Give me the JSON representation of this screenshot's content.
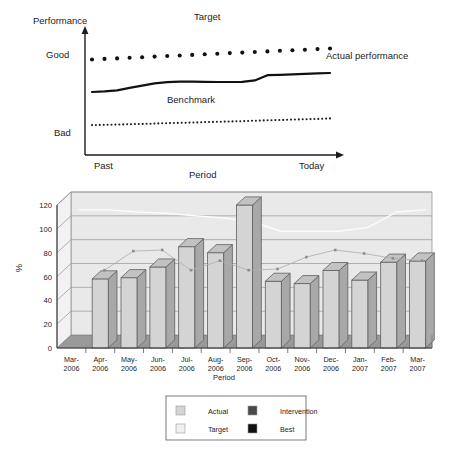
{
  "top_chart": {
    "yaxis_label": "Performance",
    "xaxis_label": "Period",
    "y_ticks": [
      "Good",
      "Bad"
    ],
    "x_ticks": [
      "Past",
      "Today"
    ],
    "series_labels": {
      "target": "Target",
      "actual": "Actual performance",
      "benchmark": "Benchmark"
    }
  },
  "chart_data": [
    {
      "type": "line",
      "title": "",
      "xlabel": "Period",
      "ylabel": "Performance",
      "x": [
        "Past",
        "Today"
      ],
      "ytick_labels": [
        "Bad",
        "Good"
      ],
      "grid": false,
      "legend": "inline-annotations",
      "annotations": [
        "Target",
        "Actual performance",
        "Benchmark"
      ],
      "series": [
        {
          "name": "Target",
          "style": "dotted-thick",
          "values": [
            0.78,
            0.785,
            0.79,
            0.795,
            0.8,
            0.805,
            0.81,
            0.815,
            0.82,
            0.825,
            0.83,
            0.835,
            0.84,
            0.845,
            0.85,
            0.855,
            0.86,
            0.865,
            0.87,
            0.875
          ]
        },
        {
          "name": "Actual performance",
          "style": "solid-thick",
          "values": [
            0.5,
            0.505,
            0.515,
            0.535,
            0.555,
            0.575,
            0.585,
            0.59,
            0.59,
            0.588,
            0.586,
            0.586,
            0.588,
            0.6,
            0.645,
            0.648,
            0.652,
            0.656,
            0.66,
            0.664
          ]
        },
        {
          "name": "Benchmark",
          "style": "dotted-fine",
          "values": [
            0.215,
            0.217,
            0.219,
            0.222,
            0.225,
            0.228,
            0.231,
            0.234,
            0.237,
            0.24,
            0.243,
            0.246,
            0.249,
            0.252,
            0.256,
            0.259,
            0.262,
            0.265,
            0.268,
            0.272
          ]
        }
      ]
    },
    {
      "type": "bar",
      "title": "",
      "xlabel": "Period",
      "ylabel": "%",
      "ylim": [
        0,
        120
      ],
      "ytick_values": [
        0,
        20,
        40,
        60,
        80,
        100,
        120
      ],
      "ytick_labels": [
        "0",
        "20",
        "40",
        "60",
        "80",
        "100",
        "120"
      ],
      "grid": true,
      "three_d": true,
      "legend_position": "bottom",
      "categories": [
        "Mar-2006",
        "Apr-2006",
        "May-2006",
        "Jun-2006",
        "Jul-2006",
        "Aug-2006",
        "Sep-2006",
        "Oct-2006",
        "Nov-2006",
        "Dec-2006",
        "Jan-2007",
        "Feb-2007",
        "Mar-2007"
      ],
      "category_lines": [
        [
          "Mar-",
          "2006"
        ],
        [
          "Apr-",
          "2006"
        ],
        [
          "May-",
          "2006"
        ],
        [
          "Jun-",
          "2006"
        ],
        [
          "Jul-",
          "2006"
        ],
        [
          "Aug-",
          "2006"
        ],
        [
          "Sep-",
          "2006"
        ],
        [
          "Oct-",
          "2006"
        ],
        [
          "Nov-",
          "2006"
        ],
        [
          "Dec-",
          "2006"
        ],
        [
          "Jan-",
          "2007"
        ],
        [
          "Feb-",
          "2007"
        ],
        [
          "Mar-",
          "2007"
        ]
      ],
      "series": [
        {
          "name": "Actual",
          "kind": "bar",
          "color": "#d4d4d4",
          "values": [
            null,
            58,
            59,
            68,
            85,
            80,
            120,
            56,
            54,
            65,
            57,
            72,
            73
          ]
        },
        {
          "name": "Target",
          "kind": "line",
          "color": "#b8b8b8",
          "values": [
            null,
            62,
            78,
            79,
            62,
            70,
            62,
            63,
            73,
            79,
            76,
            72,
            70
          ]
        },
        {
          "name": "Best",
          "kind": "line",
          "color": "#f2f2f2",
          "values": [
            110,
            110,
            108,
            107,
            105,
            103,
            100,
            92,
            92,
            92,
            95,
            108,
            110
          ]
        },
        {
          "name": "Intervention",
          "kind": "marker",
          "color": "#4a4a4a",
          "values": []
        }
      ],
      "legend": [
        {
          "label": "Actual",
          "color": "#d4d4d4"
        },
        {
          "label": "Intervention",
          "color": "#4a4a4a"
        },
        {
          "label": "Target",
          "color": "#f0f0f0"
        },
        {
          "label": "Best",
          "color": "#111111"
        }
      ]
    }
  ]
}
